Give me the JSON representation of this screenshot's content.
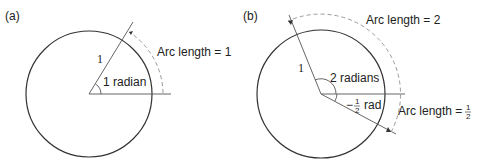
{
  "panel_a": {
    "tag": "(a)",
    "radius_label": "1",
    "angle_label": "1 radian",
    "arc_label": "Arc length = 1"
  },
  "panel_b": {
    "tag": "(b)",
    "radius_label": "1",
    "angle_label": "2 radians",
    "neg_angle_prefix": "−",
    "neg_angle_num": "1",
    "neg_angle_den": "2",
    "neg_angle_unit": "rad",
    "arc_label_top": "Arc length = 2",
    "arc_label_bottom_text": "Arc length = ",
    "arc_label_bottom_num": "1",
    "arc_label_bottom_den": "2"
  },
  "colors": {
    "stroke": "#333333",
    "dashed": "#999999"
  }
}
